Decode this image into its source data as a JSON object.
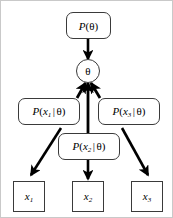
{
  "diagram": {
    "background_color": "#ffffff",
    "stroke_color": "#000000",
    "node_border_color": "#3a3a3a",
    "nodes": {
      "prior": {
        "label_fn": "P",
        "label_open": "(",
        "label_theta": "θ",
        "label_close": ")",
        "shape": "rounded-rect"
      },
      "theta": {
        "label": "θ",
        "shape": "circle"
      },
      "likelihood_1": {
        "label_fn": "P",
        "label_open": "(",
        "label_var": "x",
        "label_sub": "1",
        "label_bar": "|",
        "label_theta": "θ",
        "label_close": ")",
        "shape": "rounded-rect"
      },
      "likelihood_2": {
        "label_fn": "P",
        "label_open": "(",
        "label_var": "x",
        "label_sub": "2",
        "label_bar": "|",
        "label_theta": "θ",
        "label_close": ")",
        "shape": "rounded-rect"
      },
      "likelihood_3": {
        "label_fn": "P",
        "label_open": "(",
        "label_var": "x",
        "label_sub": "3",
        "label_bar": "|",
        "label_theta": "θ",
        "label_close": ")",
        "shape": "rounded-rect"
      },
      "observation_1": {
        "label_var": "x",
        "label_sub": "1",
        "shape": "square"
      },
      "observation_2": {
        "label_var": "x",
        "label_sub": "2",
        "shape": "square"
      },
      "observation_3": {
        "label_var": "x",
        "label_sub": "3",
        "shape": "square"
      }
    },
    "edges": [
      {
        "name": "prior-to-theta",
        "from": "prior",
        "to": "theta",
        "direction": "down"
      },
      {
        "name": "likelihood-1-to-theta",
        "from": "likelihood_1",
        "to": "theta",
        "direction": "up"
      },
      {
        "name": "likelihood-2-to-theta",
        "from": "likelihood_2",
        "to": "theta",
        "direction": "up"
      },
      {
        "name": "likelihood-3-to-theta",
        "from": "likelihood_3",
        "to": "theta",
        "direction": "up"
      },
      {
        "name": "likelihood-1-to-x1",
        "from": "likelihood_1",
        "to": "observation_1",
        "direction": "down-left"
      },
      {
        "name": "likelihood-2-to-x2",
        "from": "likelihood_2",
        "to": "observation_2",
        "direction": "down"
      },
      {
        "name": "likelihood-3-to-x3",
        "from": "likelihood_3",
        "to": "observation_3",
        "direction": "down-right"
      }
    ]
  }
}
